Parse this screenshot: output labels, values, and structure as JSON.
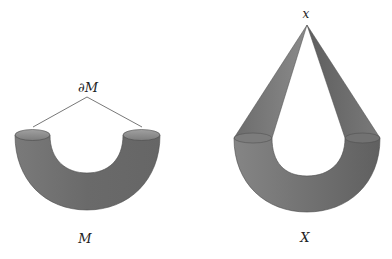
{
  "figures": [
    {
      "id": "M",
      "label": "M",
      "boundary_label": "∂M",
      "description": "Half-torus (bent tube) with two open circular boundary ends"
    },
    {
      "id": "X",
      "label": "X",
      "apex_label": "x",
      "description": "Bent tube with both boundary circles coned off to a single point x"
    }
  ],
  "colors": {
    "tube_fill": "#6e6e6e",
    "tube_dark": "#555555",
    "tube_light": "#8a8a8a",
    "ellipse_fill": "#8c8c8c",
    "cone_fill": "#707070",
    "line": "#555555"
  }
}
